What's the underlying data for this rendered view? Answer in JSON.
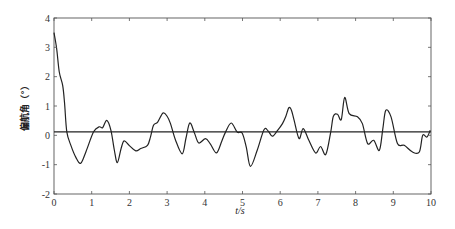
{
  "chart_data": {
    "type": "line",
    "title": "",
    "xlabel": "t/s",
    "ylabel": "偏航角（°）",
    "xlim": [
      0,
      10
    ],
    "ylim": [
      -2,
      4
    ],
    "xticks": [
      0,
      1,
      2,
      3,
      4,
      5,
      6,
      7,
      8,
      9,
      10
    ],
    "yticks": [
      -2,
      -1,
      0,
      1,
      2,
      3,
      4
    ],
    "grid": false,
    "box": true,
    "legend": null,
    "series": [
      {
        "name": "yaw angle",
        "color": "#222222",
        "x": [
          0,
          0.07,
          0.14,
          0.23,
          0.28,
          0.34,
          0.45,
          0.58,
          0.71,
          0.85,
          1.05,
          1.2,
          1.29,
          1.4,
          1.51,
          1.6,
          1.68,
          1.78,
          1.86,
          2.0,
          2.17,
          2.3,
          2.48,
          2.56,
          2.64,
          2.75,
          2.89,
          3.0,
          3.09,
          3.22,
          3.4,
          3.5,
          3.6,
          3.72,
          3.84,
          4.02,
          4.15,
          4.31,
          4.45,
          4.55,
          4.7,
          4.86,
          4.99,
          5.1,
          5.21,
          5.39,
          5.57,
          5.68,
          5.79,
          5.92,
          6.06,
          6.15,
          6.23,
          6.3,
          6.37,
          6.5,
          6.61,
          6.76,
          6.94,
          7.07,
          7.21,
          7.34,
          7.41,
          7.52,
          7.62,
          7.71,
          7.83,
          8.05,
          8.18,
          8.32,
          8.48,
          8.63,
          8.72,
          8.8,
          8.94,
          9.11,
          9.29,
          9.51,
          9.69,
          9.78,
          9.89,
          9.98
        ],
        "values": [
          3.5,
          2.96,
          2.16,
          1.7,
          1.1,
          0.12,
          -0.35,
          -0.75,
          -0.95,
          -0.55,
          0.12,
          0.29,
          0.26,
          0.51,
          0.17,
          -0.5,
          -0.93,
          -0.45,
          -0.19,
          -0.35,
          -0.53,
          -0.45,
          -0.34,
          -0.05,
          0.34,
          0.45,
          0.76,
          0.65,
          0.4,
          -0.15,
          -0.63,
          -0.1,
          0.42,
          0.1,
          -0.26,
          -0.11,
          -0.3,
          -0.6,
          -0.2,
          0.11,
          0.42,
          0.11,
          0.08,
          -0.4,
          -1.06,
          -0.51,
          0.19,
          0.15,
          -0.03,
          0.15,
          0.4,
          0.65,
          0.94,
          0.85,
          0.51,
          -0.11,
          0.23,
          -0.17,
          -0.6,
          -0.38,
          -0.65,
          0.11,
          0.65,
          0.72,
          0.54,
          1.29,
          0.74,
          0.63,
          0.4,
          -0.28,
          -0.17,
          -0.51,
          0.2,
          0.85,
          0.63,
          -0.28,
          -0.34,
          -0.57,
          -0.57,
          0.0,
          -0.06,
          0.17
        ]
      },
      {
        "name": "reference line",
        "color": "#222222",
        "x": [
          0,
          10
        ],
        "values": [
          0.12,
          0.12
        ]
      }
    ]
  }
}
